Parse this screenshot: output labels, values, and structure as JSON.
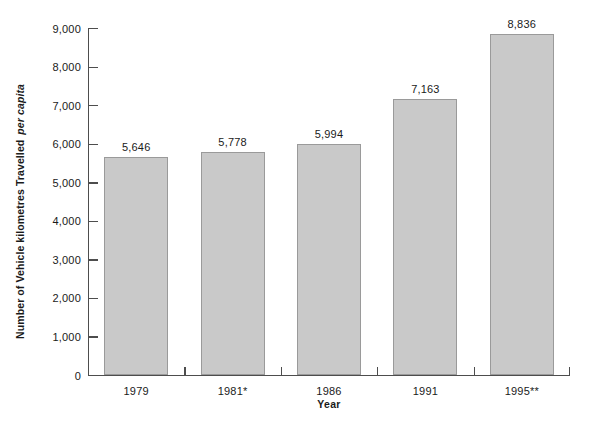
{
  "chart_data": {
    "type": "bar",
    "title": "",
    "subtitle": "",
    "xlabel": "Year",
    "ylabel_main": "Number of Vehicle kilometres Travelled",
    "ylabel_em": "per capita",
    "ylabel_full": "Number of Vehicle kilometres Travelled per capita",
    "categories": [
      "1979",
      "1981*",
      "1986",
      "1991",
      "1995**"
    ],
    "values": [
      5646,
      5778,
      5994,
      7163,
      8836
    ],
    "value_labels": [
      "5,646",
      "5,778",
      "5,994",
      "7,163",
      "8,836"
    ],
    "ylim": [
      0,
      9000
    ],
    "ytick_values": [
      0,
      1000,
      2000,
      3000,
      4000,
      5000,
      6000,
      7000,
      8000,
      9000
    ],
    "ytick_labels": [
      "0",
      "1,000",
      "2,000",
      "3,000",
      "4,000",
      "5,000",
      "6,000",
      "7,000",
      "8,000",
      "9,000"
    ],
    "grid": false,
    "legend": null,
    "legend_position": "none",
    "bar_fill_color": "#c9c9c9",
    "bar_border_color": "#9a9a9a",
    "axis_color": "#4d4d4d",
    "background_color": "#ffffff",
    "text_color": "#1a1a1a"
  }
}
